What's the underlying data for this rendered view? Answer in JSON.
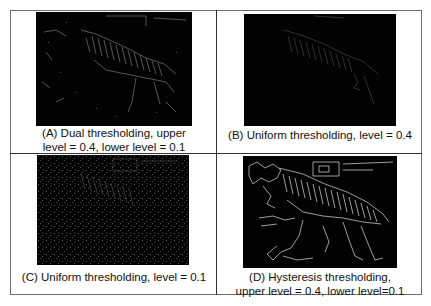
{
  "figure": {
    "panels": [
      {
        "id": "A",
        "caption_line1": "(A) Dual thresholding, upper",
        "caption_line2": "level = 0.4, lower level = 0.1",
        "image_desc": "zebra edge map, dual thresholding"
      },
      {
        "id": "B",
        "caption_line1": "(B) Uniform thresholding, level = 0.4",
        "caption_line2": "",
        "image_desc": "zebra edge map, uniform threshold 0.4"
      },
      {
        "id": "C",
        "caption_line1": "(C) Uniform thresholding, level = 0.1",
        "caption_line2": "",
        "image_desc": "zebra edge map, uniform threshold 0.1"
      },
      {
        "id": "D",
        "caption_line1": "(D) Hysteresis thresholding,",
        "caption_line2": "upper level = 0.4, lower level=0.1",
        "image_desc": "zebra edge map, hysteresis thresholding"
      }
    ]
  },
  "colors": {
    "background": "#ffffff",
    "image_bg": "#020202",
    "edge": "#d8d8d8",
    "border": "#333333"
  }
}
